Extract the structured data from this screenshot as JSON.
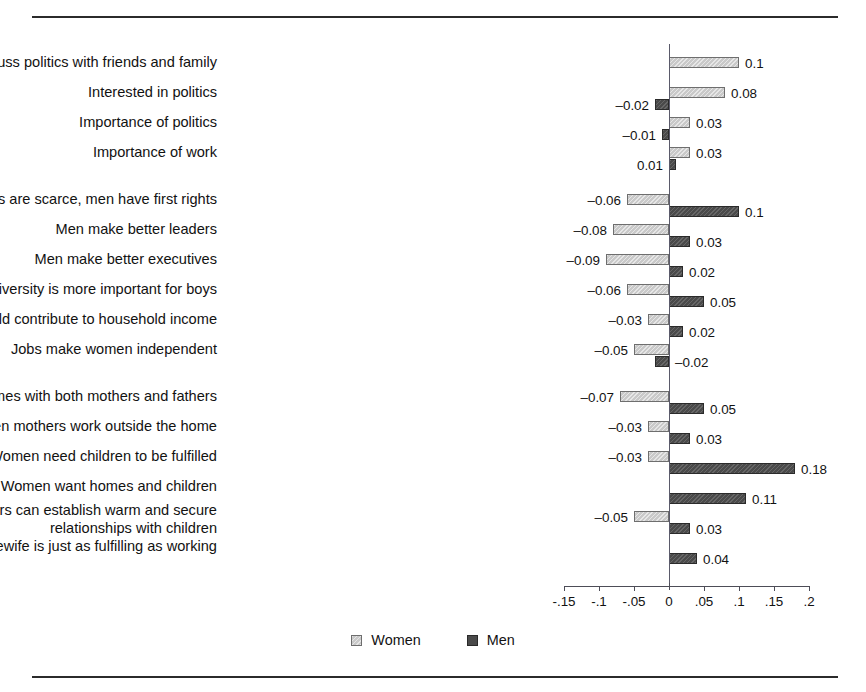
{
  "figure": {
    "top_rule": true,
    "bottom_rule": true
  },
  "legend": {
    "position": "bottom-center",
    "entries": [
      {
        "label": "Women",
        "color": "#c9c9c9",
        "swatch": "light-gray-hatched"
      },
      {
        "label": "Men",
        "color": "#4a4a4a",
        "swatch": "dark-gray"
      }
    ]
  },
  "axis": {
    "tick_labels": [
      "-.15",
      "-.1",
      "-.05",
      "0",
      ".05",
      ".1",
      ".15",
      ".2"
    ],
    "tick_values": [
      -0.15,
      -0.1,
      -0.05,
      0,
      0.05,
      0.1,
      0.15,
      0.2
    ],
    "xlim": [
      -0.15,
      0.2
    ],
    "zero_gridline": true,
    "grid": false
  },
  "chart_data": {
    "type": "bar",
    "orientation": "horizontal",
    "title": "",
    "subtitle": "",
    "xlabel": "",
    "ylabel": "",
    "xlim": [
      -0.15,
      0.2
    ],
    "xticks": [
      -0.15,
      -0.1,
      -0.05,
      0,
      0.05,
      0.1,
      0.15,
      0.2
    ],
    "xticklabels": [
      "-.15",
      "-.1",
      "-.05",
      "0",
      ".05",
      ".1",
      ".15",
      ".2"
    ],
    "grid": false,
    "legend_position": "bottom-center",
    "series": [
      {
        "name": "Women",
        "color": "#c9c9c9",
        "values": [
          0.1,
          0.08,
          0.03,
          0.03,
          -0.06,
          -0.08,
          -0.09,
          -0.06,
          -0.03,
          -0.05,
          -0.07,
          -0.03,
          -0.03,
          null,
          -0.05,
          null
        ]
      },
      {
        "name": "Men",
        "color": "#4a4a4a",
        "values": [
          null,
          -0.02,
          -0.01,
          0.01,
          0.1,
          0.03,
          0.02,
          0.05,
          0.02,
          -0.02,
          0.05,
          0.03,
          0.18,
          0.11,
          0.03,
          0.04
        ]
      }
    ],
    "categories": [
      "Discuss politics with friends and family",
      "Interested in politics",
      "Importance of politics",
      "Importance of work",
      "When jobs are scarce, men have first rights",
      "Men make better leaders",
      "Men make better executives",
      "University is more important for boys",
      "Both women and men should contribute to household income",
      "Jobs make women independent",
      "Children need homes with both mothers and fathers",
      "Preschool children suffer when mothers work outside the home",
      "Women need children to be fulfilled",
      "Women want homes and children",
      "Working mothers can establish warm and secure\nrelationships with children",
      "Being a housewife is just as fulfilling as working"
    ],
    "groups": [
      {
        "name": "politics-and-work",
        "rows": [
          0,
          1,
          2,
          3
        ]
      },
      {
        "name": "gender-roles-work",
        "rows": [
          4,
          5,
          6,
          7,
          8,
          9
        ]
      },
      {
        "name": "motherhood-and-family",
        "rows": [
          10,
          11,
          12,
          13,
          14,
          15
        ]
      }
    ],
    "rows": [
      {
        "category": "Discuss politics with friends and family",
        "two_line": false,
        "group": 0,
        "women": {
          "value": 0.1,
          "label": "0.1",
          "label_side": "right"
        },
        "men": {
          "value": null,
          "label": "",
          "label_side": "right"
        }
      },
      {
        "category": "Interested in politics",
        "two_line": false,
        "group": 0,
        "women": {
          "value": 0.08,
          "label": "0.08",
          "label_side": "right"
        },
        "men": {
          "value": -0.02,
          "label": "–0.02",
          "label_side": "left"
        }
      },
      {
        "category": "Importance of politics",
        "two_line": false,
        "group": 0,
        "women": {
          "value": 0.03,
          "label": "0.03",
          "label_side": "right"
        },
        "men": {
          "value": -0.01,
          "label": "–0.01",
          "label_side": "left"
        }
      },
      {
        "category": "Importance of work",
        "two_line": false,
        "group": 0,
        "women": {
          "value": 0.03,
          "label": "0.03",
          "label_side": "right"
        },
        "men": {
          "value": 0.01,
          "label": "0.01",
          "label_side": "left"
        }
      },
      {
        "category": "When jobs are scarce, men have first rights",
        "two_line": false,
        "group": 1,
        "women": {
          "value": -0.06,
          "label": "–0.06",
          "label_side": "left"
        },
        "men": {
          "value": 0.1,
          "label": "0.1",
          "label_side": "right"
        }
      },
      {
        "category": "Men make better leaders",
        "two_line": false,
        "group": 1,
        "women": {
          "value": -0.08,
          "label": "–0.08",
          "label_side": "left"
        },
        "men": {
          "value": 0.03,
          "label": "0.03",
          "label_side": "right"
        }
      },
      {
        "category": "Men make better executives",
        "two_line": false,
        "group": 1,
        "women": {
          "value": -0.09,
          "label": "–0.09",
          "label_side": "left"
        },
        "men": {
          "value": 0.02,
          "label": "0.02",
          "label_side": "right"
        }
      },
      {
        "category": "University is more important for boys",
        "two_line": false,
        "group": 1,
        "women": {
          "value": -0.06,
          "label": "–0.06",
          "label_side": "left"
        },
        "men": {
          "value": 0.05,
          "label": "0.05",
          "label_side": "right"
        }
      },
      {
        "category": "Both women and men should contribute to household income",
        "two_line": false,
        "group": 1,
        "women": {
          "value": -0.03,
          "label": "–0.03",
          "label_side": "left"
        },
        "men": {
          "value": 0.02,
          "label": "0.02",
          "label_side": "right"
        }
      },
      {
        "category": "Jobs make women independent",
        "two_line": false,
        "group": 1,
        "women": {
          "value": -0.05,
          "label": "–0.05",
          "label_side": "left"
        },
        "men": {
          "value": -0.02,
          "label": "–0.02",
          "label_side": "right"
        }
      },
      {
        "category": "Children need homes with both mothers and fathers",
        "two_line": false,
        "group": 2,
        "women": {
          "value": -0.07,
          "label": "–0.07",
          "label_side": "left"
        },
        "men": {
          "value": 0.05,
          "label": "0.05",
          "label_side": "right"
        }
      },
      {
        "category": "Preschool children suffer when mothers work outside the home",
        "two_line": false,
        "group": 2,
        "women": {
          "value": -0.03,
          "label": "–0.03",
          "label_side": "left"
        },
        "men": {
          "value": 0.03,
          "label": "0.03",
          "label_side": "right"
        }
      },
      {
        "category": "Women need children to be fulfilled",
        "two_line": false,
        "group": 2,
        "women": {
          "value": -0.03,
          "label": "–0.03",
          "label_side": "left"
        },
        "men": {
          "value": 0.18,
          "label": "0.18",
          "label_side": "right"
        }
      },
      {
        "category": "Women want homes and children",
        "two_line": false,
        "group": 2,
        "women": {
          "value": null,
          "label": "",
          "label_side": "left"
        },
        "men": {
          "value": 0.11,
          "label": "0.11",
          "label_side": "right"
        }
      },
      {
        "category": "Working mothers can establish warm and secure\nrelationships with children",
        "two_line": true,
        "group": 2,
        "women": {
          "value": -0.05,
          "label": "–0.05",
          "label_side": "left"
        },
        "men": {
          "value": 0.03,
          "label": "0.03",
          "label_side": "right"
        }
      },
      {
        "category": "Being a housewife is just as fulfilling as working",
        "two_line": false,
        "group": 2,
        "women": {
          "value": null,
          "label": "",
          "label_side": "left"
        },
        "men": {
          "value": 0.04,
          "label": "0.04",
          "label_side": "right"
        }
      }
    ]
  }
}
